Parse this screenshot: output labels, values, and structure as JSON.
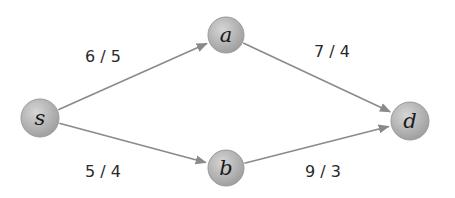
{
  "diagram": {
    "type": "flow-network",
    "colors": {
      "node_fill_light": "#cfcfcf",
      "node_fill_dark": "#9e9e9e",
      "edge": "#8a8a8a",
      "text": "#222222"
    },
    "nodes": [
      {
        "id": "s",
        "label": "s",
        "cx": 40,
        "cy": 118,
        "r": 19
      },
      {
        "id": "a",
        "label": "a",
        "cx": 226,
        "cy": 35,
        "r": 18
      },
      {
        "id": "b",
        "label": "b",
        "cx": 226,
        "cy": 168,
        "r": 18
      },
      {
        "id": "d",
        "label": "d",
        "cx": 410,
        "cy": 121,
        "r": 19
      }
    ],
    "edges": [
      {
        "from": "s",
        "to": "a",
        "label": "6 / 5",
        "label_x": 103,
        "label_y": 62
      },
      {
        "from": "a",
        "to": "d",
        "label": "7 / 4",
        "label_x": 332,
        "label_y": 57
      },
      {
        "from": "s",
        "to": "b",
        "label": "5 / 4",
        "label_x": 103,
        "label_y": 177
      },
      {
        "from": "b",
        "to": "d",
        "label": "9 / 3",
        "label_x": 323,
        "label_y": 177
      }
    ]
  }
}
